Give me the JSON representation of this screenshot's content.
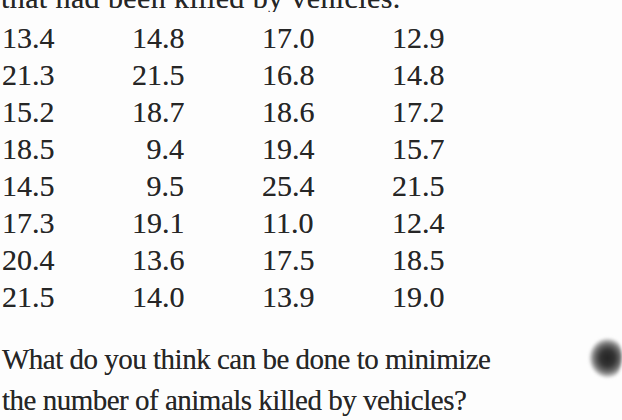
{
  "document": {
    "top_partial_line": "that had been killed by vehicles.",
    "question_line1": "What do you think can be done to minimize",
    "question_line2": "the number of animals killed by vehicles?"
  },
  "table": {
    "rows": [
      [
        "13.4",
        "14.8",
        "17.0",
        "12.9"
      ],
      [
        "21.3",
        "21.5",
        "16.8",
        "14.8"
      ],
      [
        "15.2",
        "18.7",
        "18.6",
        "17.2"
      ],
      [
        "18.5",
        "9.4",
        "19.4",
        "15.7"
      ],
      [
        "14.5",
        "9.5",
        "25.4",
        "21.5"
      ],
      [
        "17.3",
        "19.1",
        "11.0",
        "12.4"
      ],
      [
        "20.4",
        "13.6",
        "17.5",
        "18.5"
      ],
      [
        "21.5",
        "14.0",
        "13.9",
        "19.0"
      ]
    ]
  },
  "chart_data": {
    "type": "table",
    "values": [
      [
        13.4,
        14.8,
        17.0,
        12.9
      ],
      [
        21.3,
        21.5,
        16.8,
        14.8
      ],
      [
        15.2,
        18.7,
        18.6,
        17.2
      ],
      [
        18.5,
        9.4,
        19.4,
        15.7
      ],
      [
        14.5,
        9.5,
        25.4,
        21.5
      ],
      [
        17.3,
        19.1,
        11.0,
        12.4
      ],
      [
        20.4,
        13.6,
        17.5,
        18.5
      ],
      [
        21.5,
        14.0,
        13.9,
        19.0
      ]
    ]
  },
  "colors": {
    "page_background": "#fdfdfd",
    "text": "#262626"
  }
}
